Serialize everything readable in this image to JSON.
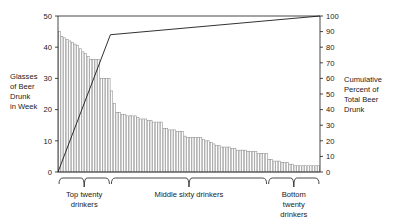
{
  "chart_data": {
    "type": "bar",
    "title": "",
    "subtitle": "",
    "xlabel": "",
    "ylabel": "Glasses of Beer Drunk in Week",
    "y2label": "Cumulative Percent of Total Beer Drunk",
    "ylim": [
      0,
      50
    ],
    "y2lim": [
      0,
      100
    ],
    "grid": false,
    "legend": false,
    "left_axis": {
      "label_lines": [
        "Glasses",
        "of Beer",
        "Drunk",
        "in Week"
      ],
      "ticks": [
        0,
        10,
        20,
        30,
        40,
        50
      ]
    },
    "right_axis": {
      "label_lines": [
        "Cumulative",
        "Percent of",
        "Total Beer",
        "Drunk"
      ],
      "ticks": [
        0,
        10,
        20,
        30,
        40,
        50,
        60,
        70,
        80,
        90,
        100
      ]
    },
    "categories": [
      "1",
      "2",
      "3",
      "4",
      "5",
      "6",
      "7",
      "8",
      "9",
      "10",
      "11",
      "12",
      "13",
      "14",
      "15",
      "16",
      "17",
      "18",
      "19",
      "20",
      "21",
      "22",
      "23",
      "24",
      "25",
      "26",
      "27",
      "28",
      "29",
      "30",
      "31",
      "32",
      "33",
      "34",
      "35",
      "36",
      "37",
      "38",
      "39",
      "40",
      "41",
      "42",
      "43",
      "44",
      "45",
      "46",
      "47",
      "48",
      "49",
      "50",
      "51",
      "52",
      "53",
      "54",
      "55",
      "56",
      "57",
      "58",
      "59",
      "60",
      "61",
      "62",
      "63",
      "64",
      "65",
      "66",
      "67",
      "68",
      "69",
      "70",
      "71",
      "72",
      "73",
      "74",
      "75",
      "76",
      "77",
      "78",
      "79",
      "80",
      "81",
      "82",
      "83",
      "84",
      "85",
      "86",
      "87",
      "88",
      "89",
      "90",
      "91",
      "92",
      "93",
      "94",
      "95",
      "96",
      "97",
      "98",
      "99",
      "100"
    ],
    "values": [
      45,
      43.5,
      43,
      42.5,
      42,
      41.5,
      41,
      40.5,
      39.5,
      38.5,
      38,
      37,
      36,
      36,
      36,
      36,
      30,
      30,
      30,
      30,
      26,
      22,
      19,
      19,
      18.5,
      18.5,
      18,
      18,
      18,
      18,
      17.5,
      17,
      17,
      17,
      16.5,
      16.5,
      16,
      16,
      16,
      16,
      14,
      14,
      13.5,
      13.5,
      13.5,
      13,
      13,
      13,
      11.5,
      11,
      11,
      11,
      11,
      11,
      11,
      10.5,
      10,
      10,
      9.5,
      9,
      8.5,
      8.5,
      8,
      8,
      8,
      8,
      7.5,
      7.5,
      7,
      7,
      7,
      7,
      6.5,
      6.5,
      6.5,
      6.5,
      6,
      6,
      6,
      6,
      4,
      4,
      3.5,
      3.5,
      3.5,
      3,
      3,
      3,
      2.5,
      2.5,
      2,
      2,
      2,
      2,
      2,
      2,
      2,
      2,
      2,
      2
    ],
    "cumulative_percent": {
      "name": "Cumulative Percent of Total Beer Drunk",
      "points": [
        {
          "x": 0,
          "y": 0
        },
        {
          "x": 20,
          "y": 88
        },
        {
          "x": 100,
          "y": 100
        }
      ]
    },
    "groups": [
      {
        "name": "top-twenty",
        "label_lines": [
          "Top twenty",
          "drinkers"
        ],
        "start": 0,
        "end": 20
      },
      {
        "name": "middle-sixty",
        "label_lines": [
          "Middle sixty drinkers"
        ],
        "start": 20,
        "end": 80
      },
      {
        "name": "bottom-twenty",
        "label_lines": [
          "Bottom",
          "twenty",
          "drinkers"
        ],
        "start": 80,
        "end": 100
      }
    ],
    "colors": {
      "bar_fill": "#ffffff",
      "bar_stroke": "#8a8a8a",
      "line": "#1a1a1a",
      "axis": "#1a1a1a",
      "text": "#1a1a1a",
      "background": "#ffffff"
    }
  }
}
